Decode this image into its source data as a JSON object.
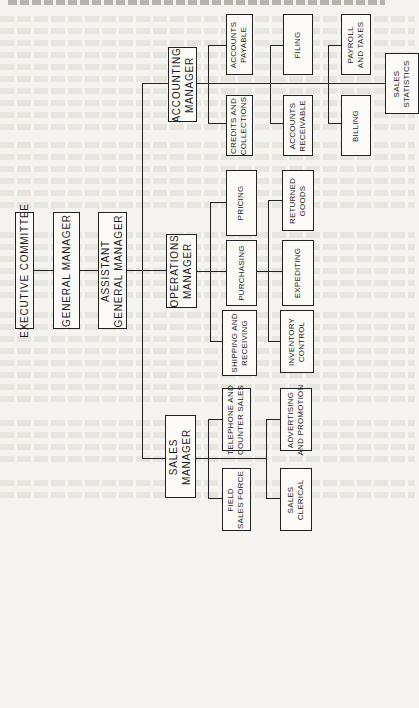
{
  "page": {
    "header_text": ""
  },
  "chart": {
    "top": {
      "executive": "EXECUTIVE COMMITTEE",
      "general_manager": "GENERAL MANAGER",
      "assistant_gm": "ASSISTANT\nGENERAL MANAGER"
    },
    "managers": {
      "accounting": "ACCOUNTING\nMANAGER",
      "operations": "OPERATIONS\nMANAGER",
      "sales": "SALES\nMANAGER"
    },
    "accounting_units": {
      "accounts_payable": "ACCOUNTS\nPAYABLE",
      "credits_collections": "CREDITS AND\nCOLLECTIONS",
      "filing": "FILING",
      "accounts_receivable": "ACCOUNTS\nRECEIVABLE",
      "payroll_taxes": "PAYROLL\nAND TAXES",
      "billing": "BILLING",
      "sales_statistics": "SALES\nSTATISTICS"
    },
    "operations_units": {
      "pricing": "PRICING",
      "purchasing": "PURCHASING",
      "shipping_receiving": "SHIPPING AND\nRECEIVING",
      "returned_goods": "RETURNED\nGOODS",
      "expediting": "EXPEDITING",
      "inventory_control": "INVENTORY\nCONTROL"
    },
    "sales_units": {
      "telephone_counter": "TELEPHONE AND\nCOUNTER SALES",
      "field_sales": "FIELD\nSALES FORCE",
      "advertising_promotion": "ADVERTISING\nAND PROMOTION",
      "sales_clerical": "SALES\nCLERICAL"
    }
  }
}
